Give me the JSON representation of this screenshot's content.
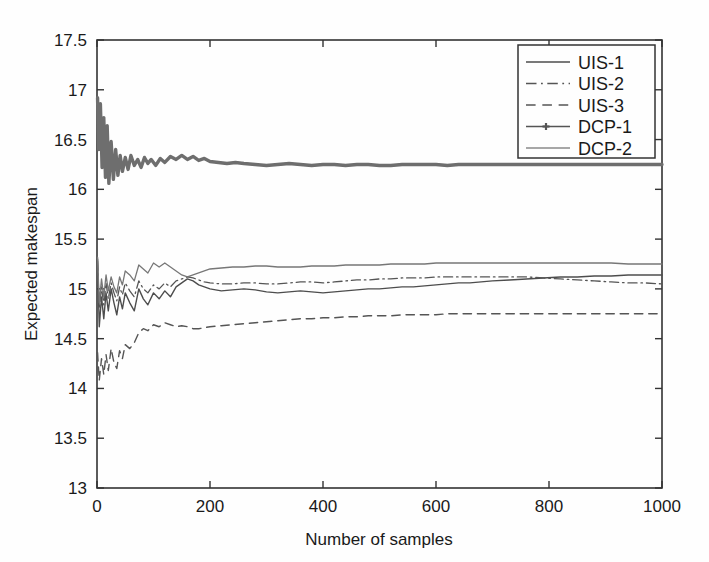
{
  "chart_data": {
    "type": "line",
    "title": "",
    "xlabel": "Number of samples",
    "ylabel": "Expected makespan",
    "xlim": [
      0,
      1000
    ],
    "ylim": [
      13,
      17.5
    ],
    "xticks": [
      0,
      200,
      400,
      600,
      800,
      1000
    ],
    "yticks": [
      13,
      13.5,
      14,
      14.5,
      15,
      15.5,
      16,
      16.5,
      17,
      17.5
    ],
    "xticklabels": [
      "0",
      "200",
      "400",
      "600",
      "800",
      "1000"
    ],
    "yticklabels": [
      "13",
      "13.5",
      "14",
      "14.5",
      "15",
      "15.5",
      "16",
      "16.5",
      "17",
      "17.5"
    ],
    "grid": false,
    "legend_position": "upper right",
    "series": [
      {
        "name": "UIS-1",
        "style": "solid",
        "color": "#4d4d4d",
        "width": 1.4,
        "x": [
          1,
          4,
          8,
          12,
          16,
          20,
          25,
          30,
          35,
          40,
          45,
          50,
          58,
          66,
          74,
          82,
          90,
          100,
          110,
          120,
          130,
          140,
          150,
          160,
          170,
          180,
          190,
          200,
          220,
          240,
          260,
          280,
          300,
          320,
          340,
          360,
          380,
          400,
          420,
          440,
          460,
          480,
          500,
          520,
          540,
          560,
          580,
          600,
          620,
          640,
          660,
          680,
          700,
          730,
          760,
          790,
          820,
          850,
          880,
          910,
          940,
          970,
          1000
        ],
        "y": [
          15.3,
          14.62,
          14.92,
          14.7,
          14.96,
          14.78,
          15.0,
          14.86,
          14.74,
          14.92,
          14.8,
          14.96,
          14.86,
          14.78,
          15.0,
          14.9,
          14.84,
          14.96,
          14.9,
          14.98,
          14.92,
          15.02,
          15.06,
          15.1,
          15.08,
          15.04,
          15.02,
          15.0,
          14.98,
          14.99,
          15.0,
          14.99,
          14.97,
          14.96,
          14.97,
          14.98,
          14.97,
          14.96,
          14.97,
          14.98,
          14.99,
          15.0,
          15.0,
          15.01,
          15.02,
          15.02,
          15.03,
          15.04,
          15.05,
          15.06,
          15.06,
          15.07,
          15.08,
          15.09,
          15.1,
          15.11,
          15.12,
          15.12,
          15.13,
          15.13,
          15.14,
          15.14,
          15.14
        ]
      },
      {
        "name": "UIS-2",
        "style": "dashdot",
        "color": "#555555",
        "width": 1.3,
        "x": [
          1,
          4,
          8,
          12,
          16,
          20,
          25,
          30,
          35,
          40,
          45,
          50,
          58,
          66,
          74,
          82,
          90,
          100,
          110,
          120,
          130,
          140,
          150,
          160,
          170,
          180,
          190,
          200,
          220,
          240,
          260,
          280,
          300,
          320,
          340,
          360,
          380,
          400,
          420,
          440,
          460,
          480,
          500,
          520,
          540,
          560,
          580,
          600,
          620,
          640,
          660,
          680,
          700,
          730,
          760,
          790,
          820,
          850,
          880,
          910,
          940,
          970,
          1000
        ],
        "y": [
          15.28,
          14.8,
          15.02,
          14.84,
          15.06,
          14.9,
          15.06,
          14.96,
          14.88,
          15.02,
          14.94,
          15.06,
          14.98,
          14.92,
          15.08,
          15.0,
          14.96,
          15.04,
          15.0,
          15.06,
          15.02,
          15.08,
          15.1,
          15.12,
          15.11,
          15.09,
          15.07,
          15.06,
          15.05,
          15.05,
          15.06,
          15.06,
          15.05,
          15.05,
          15.06,
          15.07,
          15.07,
          15.06,
          15.07,
          15.08,
          15.09,
          15.09,
          15.1,
          15.1,
          15.11,
          15.11,
          15.11,
          15.12,
          15.12,
          15.12,
          15.12,
          15.12,
          15.12,
          15.12,
          15.12,
          15.11,
          15.1,
          15.09,
          15.08,
          15.07,
          15.06,
          15.06,
          15.05
        ]
      },
      {
        "name": "UIS-3",
        "style": "dashed",
        "color": "#555555",
        "width": 1.4,
        "x": [
          1,
          4,
          8,
          12,
          16,
          20,
          25,
          30,
          35,
          40,
          45,
          50,
          58,
          66,
          74,
          82,
          90,
          100,
          110,
          120,
          130,
          140,
          150,
          160,
          170,
          180,
          190,
          200,
          220,
          240,
          260,
          280,
          300,
          320,
          340,
          360,
          380,
          400,
          420,
          440,
          460,
          480,
          500,
          520,
          540,
          560,
          580,
          600,
          620,
          640,
          660,
          680,
          700,
          730,
          760,
          790,
          820,
          850,
          880,
          910,
          940,
          970,
          1000
        ],
        "y": [
          14.36,
          14.08,
          14.3,
          14.14,
          14.34,
          14.18,
          14.4,
          14.26,
          14.2,
          14.38,
          14.3,
          14.44,
          14.4,
          14.46,
          14.56,
          14.6,
          14.58,
          14.64,
          14.62,
          14.66,
          14.64,
          14.62,
          14.63,
          14.62,
          14.6,
          14.6,
          14.61,
          14.62,
          14.63,
          14.64,
          14.65,
          14.66,
          14.67,
          14.68,
          14.69,
          14.7,
          14.7,
          14.71,
          14.71,
          14.72,
          14.72,
          14.73,
          14.73,
          14.73,
          14.74,
          14.74,
          14.74,
          14.74,
          14.75,
          14.75,
          14.75,
          14.75,
          14.75,
          14.75,
          14.75,
          14.75,
          14.75,
          14.75,
          14.75,
          14.75,
          14.75,
          14.75,
          14.75
        ]
      },
      {
        "name": "DCP-1",
        "style": "solid-marker",
        "color": "#6e6e6e",
        "width": 3.4,
        "x": [
          1,
          3,
          6,
          9,
          12,
          15,
          18,
          21,
          25,
          29,
          33,
          37,
          41,
          45,
          50,
          55,
          60,
          66,
          72,
          78,
          84,
          90,
          96,
          104,
          112,
          120,
          130,
          140,
          150,
          160,
          170,
          180,
          190,
          200,
          215,
          230,
          245,
          260,
          280,
          300,
          320,
          340,
          360,
          380,
          400,
          420,
          440,
          460,
          480,
          500,
          520,
          540,
          560,
          580,
          600,
          620,
          640,
          660,
          680,
          700,
          730,
          760,
          790,
          820,
          850,
          880,
          910,
          940,
          970,
          1000
        ],
        "y": [
          16.92,
          16.4,
          16.86,
          16.22,
          16.72,
          16.12,
          16.64,
          16.06,
          16.48,
          16.1,
          16.4,
          16.14,
          16.34,
          16.18,
          16.32,
          16.2,
          16.34,
          16.24,
          16.3,
          16.22,
          16.32,
          16.26,
          16.3,
          16.24,
          16.31,
          16.27,
          16.33,
          16.3,
          16.34,
          16.3,
          16.33,
          16.29,
          16.31,
          16.28,
          16.27,
          16.26,
          16.27,
          16.26,
          16.25,
          16.24,
          16.25,
          16.26,
          16.25,
          16.24,
          16.25,
          16.25,
          16.24,
          16.25,
          16.25,
          16.24,
          16.24,
          16.25,
          16.25,
          16.25,
          16.25,
          16.24,
          16.25,
          16.25,
          16.25,
          16.25,
          16.25,
          16.25,
          16.25,
          16.25,
          16.25,
          16.25,
          16.25,
          16.25,
          16.25,
          16.25
        ]
      },
      {
        "name": "DCP-2",
        "style": "solid",
        "color": "#777777",
        "width": 1.3,
        "x": [
          1,
          4,
          8,
          12,
          16,
          20,
          25,
          30,
          35,
          40,
          45,
          50,
          58,
          66,
          74,
          82,
          90,
          100,
          110,
          120,
          130,
          140,
          150,
          160,
          170,
          180,
          190,
          200,
          220,
          240,
          260,
          280,
          300,
          320,
          340,
          360,
          380,
          400,
          420,
          440,
          460,
          480,
          500,
          520,
          540,
          560,
          580,
          600,
          620,
          640,
          660,
          680,
          700,
          730,
          760,
          790,
          820,
          850,
          880,
          910,
          940,
          970,
          1000
        ],
        "y": [
          15.32,
          14.86,
          15.1,
          14.92,
          15.14,
          14.98,
          15.12,
          15.02,
          14.96,
          15.12,
          15.04,
          15.18,
          15.14,
          15.08,
          15.24,
          15.2,
          15.16,
          15.26,
          15.22,
          15.26,
          15.22,
          15.18,
          15.14,
          15.12,
          15.14,
          15.16,
          15.18,
          15.2,
          15.21,
          15.22,
          15.22,
          15.23,
          15.23,
          15.22,
          15.22,
          15.22,
          15.23,
          15.23,
          15.23,
          15.24,
          15.24,
          15.24,
          15.24,
          15.25,
          15.25,
          15.25,
          15.25,
          15.26,
          15.26,
          15.26,
          15.26,
          15.26,
          15.26,
          15.26,
          15.26,
          15.26,
          15.26,
          15.26,
          15.26,
          15.26,
          15.25,
          15.25,
          15.25
        ]
      }
    ],
    "legend_entries": [
      {
        "label": "UIS-1",
        "style": "solid",
        "color": "#4d4d4d",
        "width": 1.6
      },
      {
        "label": "UIS-2",
        "style": "dashdot",
        "color": "#555555",
        "width": 1.5
      },
      {
        "label": "UIS-3",
        "style": "dashed",
        "color": "#555555",
        "width": 1.6
      },
      {
        "label": "DCP-1",
        "style": "solid-marker",
        "color": "#555555",
        "width": 1.4
      },
      {
        "label": "DCP-2",
        "style": "solid",
        "color": "#8a8a8a",
        "width": 1.6
      }
    ]
  }
}
